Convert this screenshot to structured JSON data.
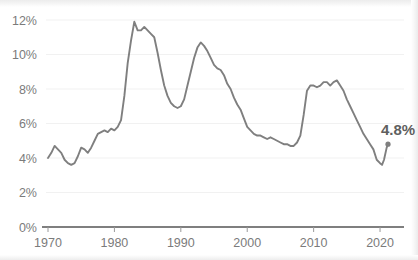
{
  "chart_data": {
    "type": "line",
    "title": "",
    "subtitle": "",
    "xlabel": "",
    "ylabel": "",
    "xlim": [
      1970,
      2021.5
    ],
    "ylim": [
      0,
      12.6
    ],
    "grid": true,
    "legend_position": "none",
    "line_color": "#7f7f7f",
    "axis_color": "#555555",
    "grid_color": "#f1f1f1",
    "tick_label_color": "#7b7b7b",
    "background_color": "#ffffff",
    "x_ticks": [
      1970,
      1980,
      1990,
      2000,
      2010,
      2020
    ],
    "x_tick_labels": [
      "1970",
      "1980",
      "1990",
      "2000",
      "2010",
      "2020"
    ],
    "y_ticks": [
      0,
      2,
      4,
      6,
      8,
      10,
      12
    ],
    "y_tick_labels": [
      "0%",
      "2%",
      "4%",
      "6%",
      "8%",
      "10%",
      "12%"
    ],
    "annotations": [
      {
        "name": "end-value-label",
        "text": "4.8%",
        "x": 2021.2,
        "y": 4.8,
        "marker": true
      }
    ],
    "series": [
      {
        "name": "Unemployment rate",
        "x": [
          1970.0,
          1970.5,
          1971.0,
          1971.5,
          1972.0,
          1972.5,
          1973.0,
          1973.5,
          1974.0,
          1974.5,
          1975.0,
          1975.5,
          1976.0,
          1976.5,
          1977.0,
          1977.5,
          1978.0,
          1978.5,
          1979.0,
          1979.5,
          1980.0,
          1980.5,
          1981.0,
          1981.5,
          1982.0,
          1982.5,
          1983.0,
          1983.5,
          1984.0,
          1984.5,
          1985.0,
          1985.5,
          1986.0,
          1986.5,
          1987.0,
          1987.5,
          1988.0,
          1988.5,
          1989.0,
          1989.5,
          1990.0,
          1990.5,
          1991.0,
          1991.5,
          1992.0,
          1992.5,
          1993.0,
          1993.5,
          1994.0,
          1994.5,
          1995.0,
          1995.5,
          1996.0,
          1996.5,
          1997.0,
          1997.5,
          1998.0,
          1998.5,
          1999.0,
          1999.5,
          2000.0,
          2000.5,
          2001.0,
          2001.5,
          2002.0,
          2002.5,
          2003.0,
          2003.5,
          2004.0,
          2004.5,
          2005.0,
          2005.5,
          2006.0,
          2006.5,
          2007.0,
          2007.5,
          2008.0,
          2008.5,
          2009.0,
          2009.5,
          2010.0,
          2010.5,
          2011.0,
          2011.5,
          2012.0,
          2012.5,
          2013.0,
          2013.5,
          2014.0,
          2014.5,
          2015.0,
          2015.5,
          2016.0,
          2016.5,
          2017.0,
          2017.5,
          2018.0,
          2018.5,
          2019.0,
          2019.5,
          2020.0,
          2020.3,
          2020.6,
          2021.0,
          2021.2
        ],
        "values": [
          4.0,
          4.3,
          4.7,
          4.5,
          4.3,
          3.9,
          3.7,
          3.6,
          3.7,
          4.1,
          4.6,
          4.5,
          4.3,
          4.6,
          5.0,
          5.4,
          5.5,
          5.6,
          5.5,
          5.7,
          5.6,
          5.8,
          6.2,
          7.6,
          9.5,
          10.8,
          11.9,
          11.4,
          11.4,
          11.6,
          11.4,
          11.2,
          11.0,
          10.1,
          9.1,
          8.2,
          7.6,
          7.2,
          7.0,
          6.9,
          7.0,
          7.4,
          8.2,
          9.0,
          9.8,
          10.4,
          10.7,
          10.5,
          10.2,
          9.8,
          9.4,
          9.2,
          9.1,
          8.8,
          8.3,
          8.0,
          7.5,
          7.1,
          6.8,
          6.3,
          5.8,
          5.6,
          5.4,
          5.3,
          5.3,
          5.2,
          5.1,
          5.2,
          5.1,
          5.0,
          4.9,
          4.8,
          4.8,
          4.7,
          4.7,
          4.9,
          5.3,
          6.5,
          7.9,
          8.2,
          8.2,
          8.1,
          8.2,
          8.4,
          8.4,
          8.2,
          8.4,
          8.5,
          8.2,
          7.9,
          7.4,
          7.0,
          6.6,
          6.2,
          5.8,
          5.4,
          5.1,
          4.8,
          4.5,
          3.9,
          3.7,
          3.6,
          3.9,
          4.6,
          4.8
        ]
      }
    ]
  }
}
